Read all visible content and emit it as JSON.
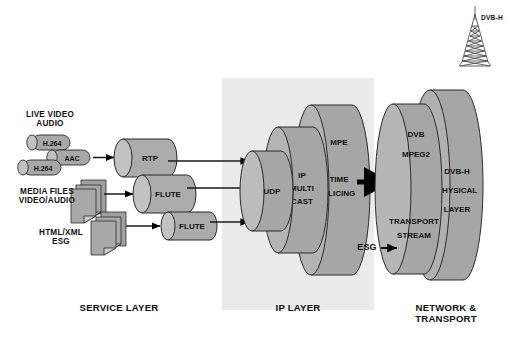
{
  "diagram": {
    "background": "#ffffff",
    "ip_band_color": "#ebebeb",
    "cylinder_body": "#a8a8a8",
    "cylinder_cap": "#c0c0c0",
    "cylinder_light": "#b8b8b8",
    "doc_fill": "#a0a0a0",
    "stroke": "#2b2b2b"
  },
  "tower": {
    "label": "DVB-H",
    "icon": "broadcast-tower-icon"
  },
  "sources": [
    {
      "id": "live",
      "label": "LIVE VIDEO\nAUDIO"
    },
    {
      "id": "media",
      "label": "MEDIA FILES\nVIDEO/AUDIO"
    },
    {
      "id": "esg",
      "label": "HTML/XML\nESG"
    }
  ],
  "codecs": [
    {
      "id": "h264-top",
      "label": "H.264"
    },
    {
      "id": "aac",
      "label": "AAC"
    },
    {
      "id": "h264-bottom",
      "label": "H.264"
    }
  ],
  "transport_protocols": [
    {
      "id": "rtp",
      "label": "RTP"
    },
    {
      "id": "flute-1",
      "label": "FLUTE"
    },
    {
      "id": "flute-2",
      "label": "FLUTE"
    }
  ],
  "ip_layer": {
    "udp": "UDP",
    "multicast": [
      "IP",
      "MULTI",
      "CAST"
    ],
    "mpe": "MPE",
    "time_slicing": [
      "TIME",
      "SLICING"
    ]
  },
  "network_layer": {
    "dvb": "DVB",
    "mpeg2": "MPEG2",
    "transport_stream": [
      "TRANSPORT",
      "STREAM"
    ],
    "physical": [
      "DVB-H",
      "PHYSICAL",
      "LAYER"
    ],
    "esg_arrow_label": "ESG"
  },
  "layer_labels": [
    {
      "id": "service",
      "label": "SERVICE LAYER"
    },
    {
      "id": "ip",
      "label": "IP LAYER"
    },
    {
      "id": "network",
      "label": "NETWORK &\nTRANSPORT"
    }
  ]
}
